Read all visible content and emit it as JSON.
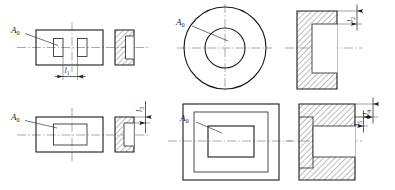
{
  "drawing": {
    "title": "Engineering section drawing — four tolerance-chain views",
    "colors": {
      "background": "#ffffff",
      "outline": "#1a1a1a",
      "thin_outline": "#2b2b2b",
      "centerline": "#6e6e6e",
      "leader": "#3a3a3a",
      "hatch": "#333333"
    },
    "quadrants": [
      {
        "id": "top-left",
        "name": "slotted-plate-view",
        "plan_note": "rectangular plate with two vertical slots",
        "section_note": "hatched section with open notch at right",
        "leader_label": "A",
        "leader_subscript": "0",
        "dimension_label": "l",
        "dimension_subscript": "1"
      },
      {
        "id": "top-right",
        "name": "annular-ring-view",
        "plan_note": "two concentric circles",
        "section_note": "hatched section with rectangular bore open at right",
        "leader_label": "A",
        "leader_subscript": "0",
        "dimension_label": "l",
        "dimension_subscript": "2"
      },
      {
        "id": "bottom-left",
        "name": "pocket-plate-view",
        "plan_note": "rectangular plate with rectangular pocket",
        "section_note": "hatched section with C-shaped notch",
        "leader_label": "A",
        "leader_subscript": "0",
        "dimension_label": "l",
        "dimension_subscript": "3"
      },
      {
        "id": "bottom-right",
        "name": "nested-pocket-view",
        "plan_note": "three nested rectangles",
        "section_note": "hatched section with stepped pocket",
        "leader_label": "A",
        "leader_subscript": "0",
        "dimension_labels": [
          {
            "label": "l",
            "subscript": "4"
          },
          {
            "label": "l",
            "subscript": "5"
          }
        ]
      }
    ]
  },
  "labels": {
    "a0_tl": {
      "base": "A",
      "sub": "0"
    },
    "a0_tr": {
      "base": "A",
      "sub": "0"
    },
    "a0_bl": {
      "base": "A",
      "sub": "0"
    },
    "a0_br": {
      "base": "A",
      "sub": "0"
    },
    "l1": {
      "base": "l",
      "sub": "1"
    },
    "l2": {
      "base": "l",
      "sub": "2"
    },
    "l3": {
      "base": "l",
      "sub": "3"
    },
    "l4": {
      "base": "l",
      "sub": "4"
    },
    "l5": {
      "base": "l",
      "sub": "5"
    }
  }
}
